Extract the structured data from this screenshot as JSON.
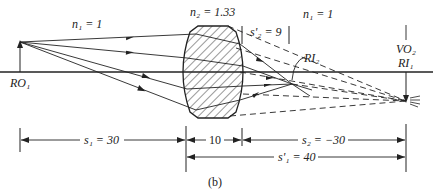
{
  "figure": {
    "caption": "(b)",
    "media_labels": {
      "left": "n₁ = 1",
      "lens": "n₂ = 1.33",
      "right": "n₁ = 1"
    },
    "object_label": "RO₁",
    "intermediate_image_label": "RI₂",
    "final_image_label_top": "VO₂",
    "final_image_label_bottom": "RI₁",
    "s2_prime_label": "s'₂ = 9",
    "dimensions": {
      "s1": "s₁ = 30",
      "thickness": "10",
      "s2": "s₂ = −30",
      "s1_prime": "s'₁ = 40"
    }
  },
  "colors": {
    "line": "#222222",
    "hatch": "#333333",
    "background": "#ffffff"
  }
}
